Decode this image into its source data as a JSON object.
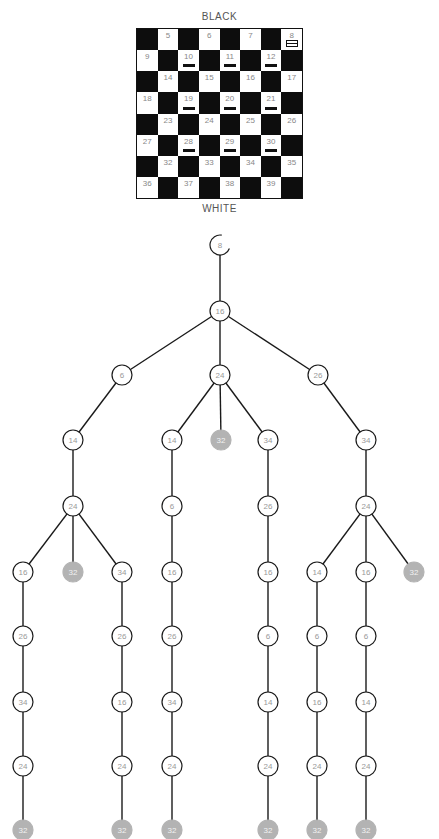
{
  "board": {
    "top_label": "BLACK",
    "bottom_label": "WHITE",
    "rows": [
      [
        {
          "c": "d"
        },
        {
          "c": "l",
          "n": "5"
        },
        {
          "c": "d"
        },
        {
          "c": "l",
          "n": "6"
        },
        {
          "c": "d"
        },
        {
          "c": "l",
          "n": "7"
        },
        {
          "c": "d"
        },
        {
          "c": "l",
          "n": "8",
          "p": "king"
        }
      ],
      [
        {
          "c": "l",
          "n": "9"
        },
        {
          "c": "d"
        },
        {
          "c": "l",
          "n": "10",
          "p": "man"
        },
        {
          "c": "d"
        },
        {
          "c": "l",
          "n": "11",
          "p": "man"
        },
        {
          "c": "d"
        },
        {
          "c": "l",
          "n": "12",
          "p": "man"
        },
        {
          "c": "d"
        }
      ],
      [
        {
          "c": "d"
        },
        {
          "c": "l",
          "n": "14"
        },
        {
          "c": "d"
        },
        {
          "c": "l",
          "n": "15"
        },
        {
          "c": "d"
        },
        {
          "c": "l",
          "n": "16"
        },
        {
          "c": "d"
        },
        {
          "c": "l",
          "n": "17"
        }
      ],
      [
        {
          "c": "l",
          "n": "18"
        },
        {
          "c": "d"
        },
        {
          "c": "l",
          "n": "19",
          "p": "man"
        },
        {
          "c": "d"
        },
        {
          "c": "l",
          "n": "20",
          "p": "man"
        },
        {
          "c": "d"
        },
        {
          "c": "l",
          "n": "21",
          "p": "man"
        },
        {
          "c": "d"
        }
      ],
      [
        {
          "c": "d"
        },
        {
          "c": "l",
          "n": "23"
        },
        {
          "c": "d"
        },
        {
          "c": "l",
          "n": "24"
        },
        {
          "c": "d"
        },
        {
          "c": "l",
          "n": "25"
        },
        {
          "c": "d"
        },
        {
          "c": "l",
          "n": "26"
        }
      ],
      [
        {
          "c": "l",
          "n": "27"
        },
        {
          "c": "d"
        },
        {
          "c": "l",
          "n": "28",
          "p": "man"
        },
        {
          "c": "d"
        },
        {
          "c": "l",
          "n": "29",
          "p": "man"
        },
        {
          "c": "d"
        },
        {
          "c": "l",
          "n": "30",
          "p": "man"
        },
        {
          "c": "d"
        }
      ],
      [
        {
          "c": "d"
        },
        {
          "c": "l",
          "n": "32"
        },
        {
          "c": "d"
        },
        {
          "c": "l",
          "n": "33"
        },
        {
          "c": "d"
        },
        {
          "c": "l",
          "n": "34"
        },
        {
          "c": "d"
        },
        {
          "c": "l",
          "n": "35"
        }
      ],
      [
        {
          "c": "l",
          "n": "36"
        },
        {
          "c": "d"
        },
        {
          "c": "l",
          "n": "37"
        },
        {
          "c": "d"
        },
        {
          "c": "l",
          "n": "38"
        },
        {
          "c": "d"
        },
        {
          "c": "l",
          "n": "39"
        },
        {
          "c": "d"
        }
      ]
    ]
  },
  "tree": {
    "colors": {
      "edge": "#1a1a1a",
      "node_stroke": "#1a1a1a",
      "node_fill": "#ffffff",
      "node_text": "#999999",
      "terminal_fill": "#b3b3b3",
      "terminal_text": "#f2f2f2"
    },
    "nodes": [
      {
        "id": "n0",
        "label": "8",
        "x": 220,
        "y": 245,
        "start": true
      },
      {
        "id": "n1",
        "label": "16",
        "x": 220,
        "y": 311
      },
      {
        "id": "n2",
        "label": "6",
        "x": 122,
        "y": 375
      },
      {
        "id": "n3",
        "label": "24",
        "x": 220,
        "y": 375
      },
      {
        "id": "n4",
        "label": "26",
        "x": 318,
        "y": 375
      },
      {
        "id": "n5",
        "label": "14",
        "x": 73,
        "y": 440
      },
      {
        "id": "n6",
        "label": "14",
        "x": 172,
        "y": 440
      },
      {
        "id": "n7",
        "label": "32",
        "x": 221,
        "y": 440,
        "terminal": true
      },
      {
        "id": "n8",
        "label": "34",
        "x": 268,
        "y": 440
      },
      {
        "id": "n9",
        "label": "34",
        "x": 366,
        "y": 440
      },
      {
        "id": "n10",
        "label": "24",
        "x": 73,
        "y": 506
      },
      {
        "id": "n11",
        "label": "6",
        "x": 172,
        "y": 506
      },
      {
        "id": "n12",
        "label": "26",
        "x": 268,
        "y": 506
      },
      {
        "id": "n13",
        "label": "24",
        "x": 366,
        "y": 506
      },
      {
        "id": "n14",
        "label": "16",
        "x": 23,
        "y": 572
      },
      {
        "id": "n15",
        "label": "32",
        "x": 73,
        "y": 572,
        "terminal": true
      },
      {
        "id": "n16",
        "label": "34",
        "x": 122,
        "y": 572
      },
      {
        "id": "n17",
        "label": "16",
        "x": 172,
        "y": 572
      },
      {
        "id": "n18",
        "label": "16",
        "x": 268,
        "y": 572
      },
      {
        "id": "n19",
        "label": "14",
        "x": 317,
        "y": 572
      },
      {
        "id": "n20",
        "label": "16",
        "x": 366,
        "y": 572
      },
      {
        "id": "n21",
        "label": "32",
        "x": 414,
        "y": 572,
        "terminal": true
      },
      {
        "id": "n22",
        "label": "26",
        "x": 23,
        "y": 636
      },
      {
        "id": "n23",
        "label": "26",
        "x": 122,
        "y": 636
      },
      {
        "id": "n24",
        "label": "26",
        "x": 172,
        "y": 636
      },
      {
        "id": "n25",
        "label": "6",
        "x": 268,
        "y": 636
      },
      {
        "id": "n26",
        "label": "6",
        "x": 317,
        "y": 636
      },
      {
        "id": "n27",
        "label": "6",
        "x": 366,
        "y": 636
      },
      {
        "id": "n28",
        "label": "34",
        "x": 23,
        "y": 702
      },
      {
        "id": "n29",
        "label": "16",
        "x": 122,
        "y": 702
      },
      {
        "id": "n30",
        "label": "34",
        "x": 172,
        "y": 702
      },
      {
        "id": "n31",
        "label": "14",
        "x": 268,
        "y": 702
      },
      {
        "id": "n32",
        "label": "16",
        "x": 317,
        "y": 702
      },
      {
        "id": "n33",
        "label": "14",
        "x": 366,
        "y": 702
      },
      {
        "id": "n34",
        "label": "24",
        "x": 23,
        "y": 766
      },
      {
        "id": "n35",
        "label": "24",
        "x": 122,
        "y": 766
      },
      {
        "id": "n36",
        "label": "24",
        "x": 172,
        "y": 766
      },
      {
        "id": "n37",
        "label": "24",
        "x": 268,
        "y": 766
      },
      {
        "id": "n38",
        "label": "24",
        "x": 317,
        "y": 766
      },
      {
        "id": "n39",
        "label": "24",
        "x": 366,
        "y": 766
      },
      {
        "id": "n40",
        "label": "32",
        "x": 23,
        "y": 830,
        "terminal": true
      },
      {
        "id": "n41",
        "label": "32",
        "x": 122,
        "y": 830,
        "terminal": true
      },
      {
        "id": "n42",
        "label": "32",
        "x": 172,
        "y": 830,
        "terminal": true
      },
      {
        "id": "n43",
        "label": "32",
        "x": 268,
        "y": 830,
        "terminal": true
      },
      {
        "id": "n44",
        "label": "32",
        "x": 317,
        "y": 830,
        "terminal": true
      },
      {
        "id": "n45",
        "label": "32",
        "x": 366,
        "y": 830,
        "terminal": true
      }
    ],
    "edges": [
      [
        "n0",
        "n1"
      ],
      [
        "n1",
        "n2"
      ],
      [
        "n1",
        "n3"
      ],
      [
        "n1",
        "n4"
      ],
      [
        "n2",
        "n5"
      ],
      [
        "n3",
        "n6"
      ],
      [
        "n3",
        "n7"
      ],
      [
        "n3",
        "n8"
      ],
      [
        "n4",
        "n9"
      ],
      [
        "n5",
        "n10"
      ],
      [
        "n6",
        "n11"
      ],
      [
        "n8",
        "n12"
      ],
      [
        "n9",
        "n13"
      ],
      [
        "n10",
        "n14"
      ],
      [
        "n10",
        "n15"
      ],
      [
        "n10",
        "n16"
      ],
      [
        "n11",
        "n17"
      ],
      [
        "n12",
        "n18"
      ],
      [
        "n13",
        "n19"
      ],
      [
        "n13",
        "n20"
      ],
      [
        "n13",
        "n21"
      ],
      [
        "n14",
        "n22"
      ],
      [
        "n16",
        "n23"
      ],
      [
        "n17",
        "n24"
      ],
      [
        "n18",
        "n25"
      ],
      [
        "n19",
        "n26"
      ],
      [
        "n20",
        "n27"
      ],
      [
        "n22",
        "n28"
      ],
      [
        "n23",
        "n29"
      ],
      [
        "n24",
        "n30"
      ],
      [
        "n25",
        "n31"
      ],
      [
        "n26",
        "n32"
      ],
      [
        "n27",
        "n33"
      ],
      [
        "n28",
        "n34"
      ],
      [
        "n29",
        "n35"
      ],
      [
        "n30",
        "n36"
      ],
      [
        "n31",
        "n37"
      ],
      [
        "n32",
        "n38"
      ],
      [
        "n33",
        "n39"
      ],
      [
        "n34",
        "n40"
      ],
      [
        "n35",
        "n41"
      ],
      [
        "n36",
        "n42"
      ],
      [
        "n37",
        "n43"
      ],
      [
        "n38",
        "n44"
      ],
      [
        "n39",
        "n45"
      ]
    ]
  }
}
